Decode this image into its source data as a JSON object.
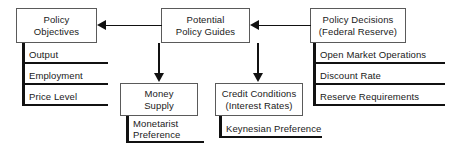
{
  "diagram": {
    "background_color": "#ffffff",
    "line_color": "#111111",
    "box_border_color": "#5a5a5a",
    "text_color": "#1a1a1a",
    "nodes": {
      "policy_objectives": {
        "line1": "Policy",
        "line2": "Objectives"
      },
      "potential_policy_guides": {
        "line1": "Potential",
        "line2": "Policy Guides"
      },
      "policy_decisions": {
        "line1": "Policy Decisions",
        "line2": "(Federal Reserve)"
      },
      "money_supply": {
        "line1": "Money",
        "line2": "Supply"
      },
      "credit_conditions": {
        "line1": "Credit Conditions",
        "line2": "(Interest Rates)"
      }
    },
    "objective_items": [
      {
        "label": "Output"
      },
      {
        "label": "Employment"
      },
      {
        "label": "Price Level"
      }
    ],
    "instrument_items": [
      {
        "label": "Open Market Operations"
      },
      {
        "label": "Discount Rate"
      },
      {
        "label": "Reserve Requirements"
      }
    ],
    "money_supply_note": {
      "line1": "Monetarist",
      "line2": "Preference"
    },
    "credit_conditions_note": {
      "line1": "Keynesian Preference"
    },
    "arrows": [
      {
        "name": "guides-to-objectives",
        "direction": "left"
      },
      {
        "name": "decisions-to-guides",
        "direction": "left"
      },
      {
        "name": "guides-to-money-supply",
        "direction": "down"
      },
      {
        "name": "guides-to-credit-conditions",
        "direction": "down"
      }
    ]
  }
}
